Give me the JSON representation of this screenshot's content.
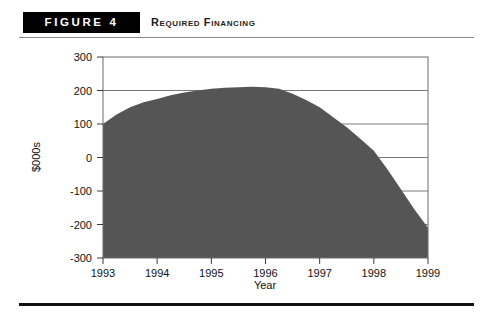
{
  "figure": {
    "badge": "FIGURE 4",
    "caption": "Required Financing"
  },
  "chart_data": {
    "type": "area",
    "title": "Required Financing",
    "xlabel": "Year",
    "ylabel": "$000s",
    "x": [
      1993,
      1994,
      1995,
      1996,
      1997,
      1998,
      1999
    ],
    "xtick_labels": [
      "1993",
      "1994",
      "1995",
      "1996",
      "1997",
      "1998",
      "1999"
    ],
    "ytick_labels": [
      "300",
      "200",
      "100",
      "0",
      "-100",
      "-200",
      "-300"
    ],
    "yticks": [
      300,
      200,
      100,
      0,
      -100,
      -200,
      -300
    ],
    "ylim": [
      -300,
      300
    ],
    "xlim": [
      1993,
      1999
    ],
    "grid": true,
    "legend": "none",
    "series": [
      {
        "name": "Required Financing",
        "fill_color": "#555555",
        "baseline": -300,
        "values": [
          100,
          175,
          205,
          210,
          150,
          20,
          -210
        ]
      }
    ],
    "dense_points": {
      "x": [
        1993,
        1993.25,
        1993.5,
        1993.75,
        1994,
        1994.25,
        1994.5,
        1994.75,
        1995,
        1995.25,
        1995.5,
        1995.75,
        1996,
        1996.25,
        1996.5,
        1996.75,
        1997,
        1997.25,
        1997.5,
        1997.75,
        1998,
        1998.25,
        1998.5,
        1998.75,
        1999
      ],
      "y": [
        100,
        128,
        150,
        165,
        175,
        186,
        194,
        200,
        205,
        208,
        210,
        211,
        210,
        205,
        190,
        172,
        150,
        120,
        90,
        56,
        20,
        -35,
        -95,
        -155,
        -210
      ]
    }
  },
  "colors": {
    "area_fill": "#555555",
    "frame": "#6b6b6b",
    "gridline": "#7a7a7a",
    "badge_bg": "#000000",
    "rule": "#111111"
  }
}
